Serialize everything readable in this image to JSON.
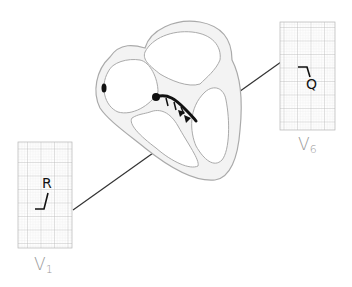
{
  "diagram": {
    "leads": [
      {
        "id": "v1",
        "label_main": "V",
        "label_sub": "1",
        "wave_label": "R"
      },
      {
        "id": "v6",
        "label_main": "V",
        "label_sub": "6",
        "wave_label": "Q"
      }
    ],
    "colors": {
      "grid_major": "#b8b8b8",
      "grid_minor": "#dcdcdc",
      "heart_outline": "#aaaaaa",
      "heart_fill": "#f3f3f3",
      "conduction": "#111111",
      "label": "#9a9a9a"
    }
  }
}
